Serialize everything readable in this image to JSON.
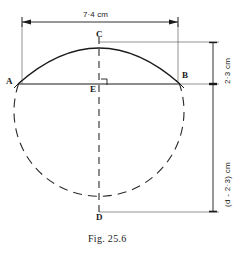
{
  "figure": {
    "caption": "Fig. 25.6",
    "caption_x": 88,
    "caption_y": 236
  },
  "points": [
    {
      "name": "A",
      "label": "A",
      "x": 18,
      "y": 84,
      "label_x": 6,
      "label_y": 77
    },
    {
      "name": "B",
      "label": "B",
      "x": 180,
      "y": 84,
      "label_x": 182,
      "label_y": 71
    },
    {
      "name": "C",
      "label": "C",
      "x": 99,
      "y": 43,
      "label_x": 96,
      "label_y": 30
    },
    {
      "name": "E",
      "label": "E",
      "x": 99,
      "y": 84,
      "label_x": 91,
      "label_y": 85
    },
    {
      "name": "D",
      "label": "D",
      "x": 99,
      "y": 212,
      "label_x": 96,
      "label_y": 213
    }
  ],
  "dimensions": [
    {
      "name": "chord-width",
      "label": "7·4 cm",
      "orientation": "horizontal",
      "label_x": 83,
      "label_y": 12,
      "line": {
        "x1": 22,
        "y1": 22,
        "x2": 178,
        "y2": 22
      }
    },
    {
      "name": "segment-height",
      "label": "2·3 cm",
      "orientation": "vertical",
      "label_x": 222,
      "label_y": 82,
      "line": {
        "x1": 213,
        "y1": 42,
        "x2": 213,
        "y2": 84
      }
    },
    {
      "name": "remaining-diameter",
      "label": "(d - 2·3) cm",
      "orientation": "vertical",
      "label_x": 222,
      "label_y": 205,
      "line": {
        "x1": 213,
        "y1": 84,
        "x2": 213,
        "y2": 212
      }
    }
  ],
  "geometry": {
    "circle": {
      "cx": 99,
      "cy": 127,
      "r": 85
    },
    "chord": {
      "x1": 18,
      "y1": 84,
      "x2": 180,
      "y2": 84
    },
    "diameter": {
      "x1": 99,
      "y1": 43,
      "x2": 99,
      "y2": 212
    },
    "arc_description": "major arc A-C-B drawn solid above chord AB",
    "dashed_description": "remainder of circle drawn dashed below chord AB"
  },
  "colors": {
    "ink": "#1a1a1a",
    "line": "#222222",
    "background": "#ffffff"
  },
  "marks": {
    "right_angle_at_E": "perpendicular mark"
  }
}
